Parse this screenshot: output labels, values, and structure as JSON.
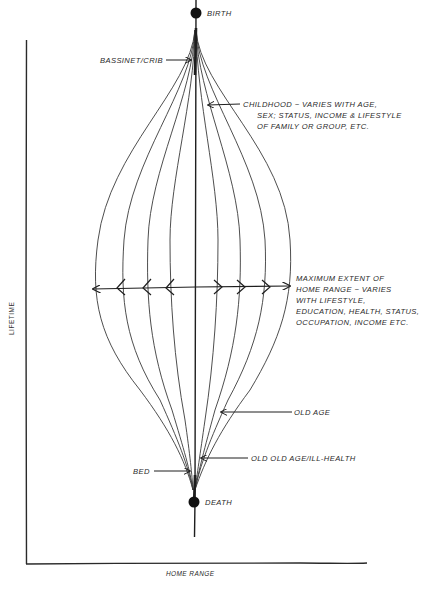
{
  "diagram": {
    "title": "",
    "axes": {
      "y_label": "LIFETIME",
      "x_label": "HOME RANGE"
    },
    "nodes": {
      "birth": "BIRTH",
      "death": "DEATH"
    },
    "annotations": {
      "bassinet": "BASSINET/CRIB",
      "childhood": [
        "CHILDHOOD ~ VARIES WITH AGE,",
        "SEX; STATUS, INCOME & LIFESTYLE",
        "OF FAMILY OR GROUP, ETC."
      ],
      "maximum": [
        "MAXIMUM EXTENT OF",
        "HOME RANGE ~ VARIES",
        "WITH LIFESTYLE,",
        "EDUCATION, HEALTH, STATUS,",
        "OCCUPATION, INCOME ETC."
      ],
      "old_age": "OLD AGE",
      "old_old_age": "OLD OLD AGE/ILL-HEALTH",
      "bed": "BED"
    },
    "colors": {
      "ink": "#1e1e1e",
      "paper": "#ffffff"
    },
    "envelope_count": 4
  }
}
